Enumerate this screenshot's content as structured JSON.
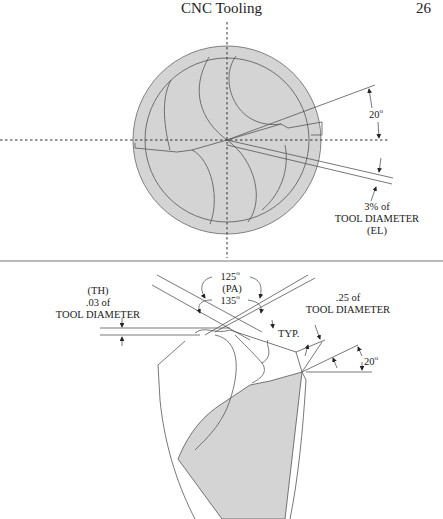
{
  "header": {
    "title": "CNC Tooling",
    "page_number": "26"
  },
  "figure_top": {
    "description": "End view of drill point",
    "annotations": {
      "angle_value": "20",
      "angle_unit": "o",
      "el_line1": "3% of",
      "el_line2": "TOOL DIAMETER",
      "el_line3": "(EL)"
    }
  },
  "figure_bottom": {
    "description": "Side view of drill point",
    "annotations": {
      "th_line1": "(TH)",
      "th_line2": ".03 of",
      "th_line3": "TOOL DIAMETER",
      "pa_top_value": "125",
      "pa_label": "(PA)",
      "pa_bottom_value": "135",
      "degree_mark": "o",
      "typ_label": "TYP.",
      "quarter_line1": ".25 of",
      "quarter_line2": "TOOL DIAMETER",
      "angle_value": "20",
      "angle_unit": "o"
    }
  },
  "colors": {
    "fill_gray": "#d4d4d4",
    "line": "#555555"
  }
}
